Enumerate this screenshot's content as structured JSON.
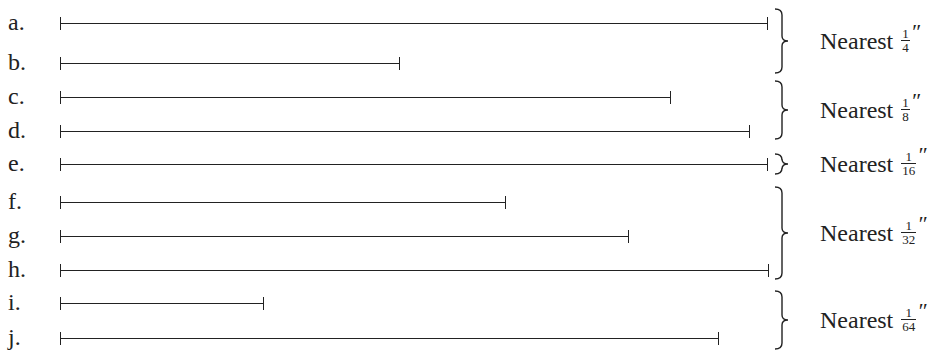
{
  "rows": [
    {
      "label": "a.",
      "y": 23,
      "x_end": 767
    },
    {
      "label": "b.",
      "y": 63,
      "x_end": 399
    },
    {
      "label": "c.",
      "y": 97,
      "x_end": 670
    },
    {
      "label": "d.",
      "y": 131,
      "x_end": 749
    },
    {
      "label": "e.",
      "y": 164,
      "x_end": 767
    },
    {
      "label": "f.",
      "y": 202,
      "x_end": 505
    },
    {
      "label": "g.",
      "y": 236,
      "x_end": 628
    },
    {
      "label": "h.",
      "y": 270,
      "x_end": 768
    },
    {
      "label": "i.",
      "y": 303,
      "x_end": 263
    },
    {
      "label": "j.",
      "y": 338,
      "x_end": 718
    }
  ],
  "line_start_x": 61,
  "groups": [
    {
      "text": "Nearest",
      "numerator": "1",
      "denominator": "4",
      "unit": "″",
      "rows": "a–b",
      "top": 8,
      "bottom": 74
    },
    {
      "text": "Nearest",
      "numerator": "1",
      "denominator": "8",
      "unit": "″",
      "rows": "c–d",
      "top": 80,
      "bottom": 140
    },
    {
      "text": "Nearest",
      "numerator": "1",
      "denominator": "16",
      "unit": "″",
      "rows": "e",
      "top": 153,
      "bottom": 175
    },
    {
      "text": "Nearest",
      "numerator": "1",
      "denominator": "32",
      "unit": "″",
      "rows": "f–h",
      "top": 186,
      "bottom": 280
    },
    {
      "text": "Nearest",
      "numerator": "1",
      "denominator": "64",
      "unit": "″",
      "rows": "i–j",
      "top": 290,
      "bottom": 350
    }
  ]
}
